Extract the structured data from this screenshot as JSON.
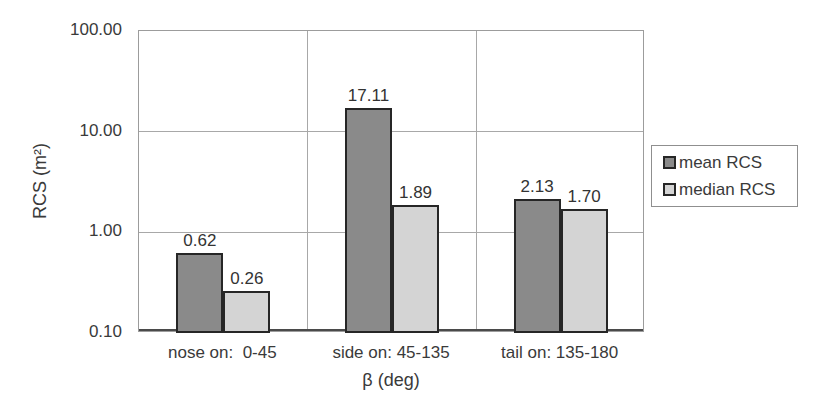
{
  "chart_data": {
    "type": "bar",
    "title": "",
    "xlabel": "β (deg)",
    "ylabel": "RCS (m²)",
    "y_scale": "log",
    "ylim": [
      0.1,
      100
    ],
    "y_ticks": [
      {
        "label": "100.00",
        "value": 100
      },
      {
        "label": "10.00",
        "value": 10
      },
      {
        "label": "1.00",
        "value": 1
      },
      {
        "label": "0.10",
        "value": 0.1
      }
    ],
    "grid": true,
    "legend_position": "right",
    "categories": [
      "nose on:  0-45",
      "side on: 45-135",
      "tail on: 135-180"
    ],
    "series": [
      {
        "name": "mean RCS",
        "color": "#8a8a8a",
        "values": [
          0.62,
          17.11,
          2.13
        ],
        "labels": [
          "0.62",
          "17.11",
          "2.13"
        ]
      },
      {
        "name": "median RCS",
        "color": "#d4d4d4",
        "values": [
          0.26,
          1.89,
          1.7
        ],
        "labels": [
          "0.26",
          "1.89",
          "1.70"
        ]
      }
    ]
  },
  "colors": {
    "bar_border": "#262626",
    "grid": "#a8a8a8",
    "plot_border": "#9c9c9c",
    "axis_line": "#4a4a4a",
    "text": "#3a3a3a",
    "background": "#ffffff"
  }
}
